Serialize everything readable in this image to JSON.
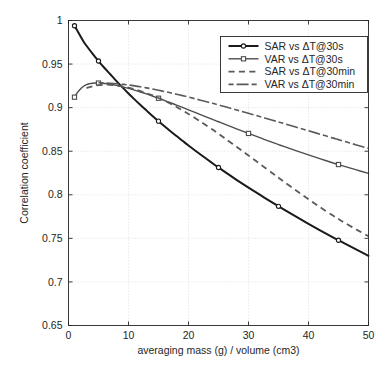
{
  "figure": {
    "background_color": "#ffffff",
    "axes_color": "#262626",
    "grid_color": "#d6d6d6"
  },
  "chart_data": {
    "type": "line",
    "title": "",
    "subtitle": "",
    "xlabel": "averaging mass (g) / volume (cm3)",
    "ylabel": "Correlation coefficient",
    "xlim": [
      0,
      50
    ],
    "ylim": [
      0.65,
      1
    ],
    "xticks": [
      0,
      10,
      20,
      30,
      40,
      50
    ],
    "yticks": [
      0.65,
      0.7,
      0.75,
      0.8,
      0.85,
      0.9,
      0.95,
      1
    ],
    "xtick_labels": [
      "0",
      "10",
      "20",
      "30",
      "40",
      "50"
    ],
    "ytick_labels": [
      "0.65",
      "0.7",
      "0.75",
      "0.8",
      "0.85",
      "0.9",
      "0.95",
      "1"
    ],
    "grid": true,
    "grid_style": "dotted",
    "legend_position": "upper right",
    "series": [
      {
        "name": "SAR vs ΔT@30s",
        "color": "#1a1a1a",
        "line_style": "solid",
        "line_width": 2.0,
        "marker": "circle",
        "marker_x": [
          1,
          5,
          15,
          25,
          35,
          45
        ],
        "x": [
          1,
          1.5,
          2,
          2.5,
          3,
          4,
          5,
          6,
          7,
          8,
          9,
          10,
          11,
          12,
          13,
          14,
          15,
          16,
          17,
          18,
          19,
          20,
          22,
          24,
          25,
          26,
          28,
          30,
          32,
          34,
          35,
          36,
          38,
          40,
          42,
          44,
          45,
          46,
          48,
          50
        ],
        "y": [
          0.994,
          0.988,
          0.982,
          0.976,
          0.971,
          0.962,
          0.9535,
          0.9455,
          0.938,
          0.9305,
          0.9232,
          0.9162,
          0.9095,
          0.903,
          0.8967,
          0.8905,
          0.8845,
          0.8787,
          0.873,
          0.8674,
          0.862,
          0.8566,
          0.8462,
          0.8362,
          0.8313,
          0.8265,
          0.8172,
          0.8082,
          0.7995,
          0.791,
          0.7868,
          0.7827,
          0.7746,
          0.7667,
          0.759,
          0.7515,
          0.7478,
          0.7442,
          0.737,
          0.7299
        ]
      },
      {
        "name": "VAR vs ΔT@30s",
        "color": "#4d4d4d",
        "line_style": "solid",
        "line_width": 1.4,
        "marker": "square",
        "marker_x": [
          1,
          5,
          15,
          30,
          45
        ],
        "x": [
          1,
          1.5,
          2,
          2.5,
          3,
          3.5,
          4,
          4.5,
          5,
          6,
          7,
          8,
          9,
          10,
          11,
          12,
          13,
          14,
          15,
          16,
          17,
          18,
          19,
          20,
          22,
          24,
          25,
          26,
          28,
          30,
          32,
          34,
          35,
          36,
          38,
          40,
          42,
          44,
          45,
          46,
          48,
          50
        ],
        "y": [
          0.912,
          0.9175,
          0.9215,
          0.9245,
          0.9265,
          0.9275,
          0.928,
          0.9282,
          0.9282,
          0.9277,
          0.9268,
          0.9255,
          0.9239,
          0.9221,
          0.9201,
          0.918,
          0.9157,
          0.9133,
          0.9108,
          0.9082,
          0.9056,
          0.9029,
          0.9002,
          0.8975,
          0.892,
          0.8865,
          0.8838,
          0.8811,
          0.8757,
          0.8704,
          0.8652,
          0.8601,
          0.8576,
          0.8552,
          0.8504,
          0.8457,
          0.8412,
          0.8368,
          0.8347,
          0.8326,
          0.8285,
          0.8246
        ]
      },
      {
        "name": "SAR vs ΔT@30min",
        "color": "#5a5a5a",
        "line_style": "dashed",
        "line_width": 1.8,
        "marker": "none",
        "marker_x": [],
        "x": [
          3,
          4,
          5,
          6,
          7,
          8,
          9,
          10,
          11,
          12,
          13,
          14,
          15,
          16,
          17,
          18,
          19,
          20,
          22,
          24,
          25,
          26,
          28,
          30,
          32,
          34,
          35,
          36,
          38,
          40,
          42,
          44,
          45,
          46,
          48,
          50
        ],
        "y": [
          0.9225,
          0.9245,
          0.9258,
          0.9263,
          0.9262,
          0.9255,
          0.9244,
          0.9229,
          0.9211,
          0.919,
          0.9166,
          0.914,
          0.9111,
          0.9079,
          0.9045,
          0.9008,
          0.8969,
          0.8928,
          0.8841,
          0.8748,
          0.87,
          0.8651,
          0.8552,
          0.8451,
          0.8349,
          0.8247,
          0.8196,
          0.8146,
          0.8046,
          0.7949,
          0.7855,
          0.7765,
          0.7722,
          0.768,
          0.76,
          0.7525
        ]
      },
      {
        "name": "VAR vs ΔT@30min",
        "color": "#5a5a5a",
        "line_style": "dashdot",
        "line_width": 1.6,
        "marker": "none",
        "marker_x": [],
        "x": [
          5,
          6,
          7,
          8,
          9,
          10,
          11,
          12,
          13,
          14,
          15,
          16,
          17,
          18,
          19,
          20,
          22,
          24,
          25,
          26,
          28,
          30,
          32,
          34,
          35,
          36,
          38,
          40,
          42,
          44,
          45,
          46,
          48,
          50
        ],
        "y": [
          0.9285,
          0.9283,
          0.928,
          0.9275,
          0.9268,
          0.926,
          0.925,
          0.9239,
          0.9227,
          0.9214,
          0.92,
          0.9185,
          0.917,
          0.9154,
          0.9138,
          0.9121,
          0.9086,
          0.905,
          0.9031,
          0.9012,
          0.8974,
          0.8935,
          0.8896,
          0.8856,
          0.8836,
          0.8816,
          0.8775,
          0.8735,
          0.8694,
          0.8653,
          0.8633,
          0.8612,
          0.8572,
          0.8532
        ]
      }
    ]
  },
  "legend": {
    "entries": [
      {
        "label": "SAR vs ΔT@30s"
      },
      {
        "label": "VAR vs ΔT@30s"
      },
      {
        "label": "SAR vs ΔT@30min"
      },
      {
        "label": "VAR vs ΔT@30min"
      }
    ]
  }
}
